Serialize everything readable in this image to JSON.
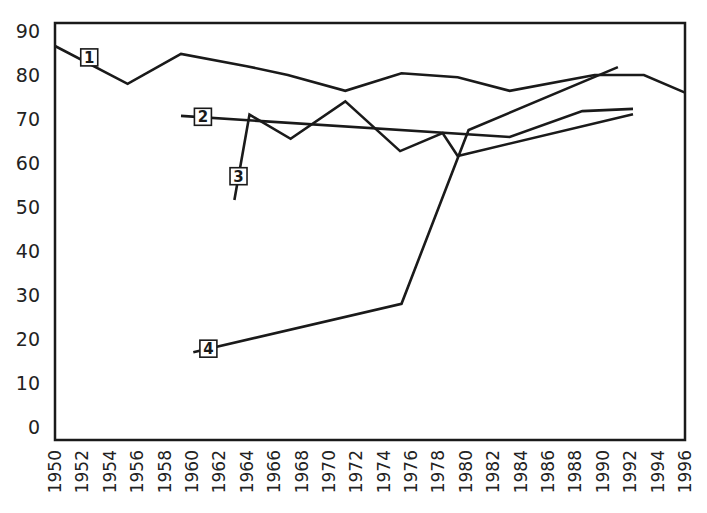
{
  "chart_data": {
    "type": "line",
    "title": "",
    "xlabel": "",
    "ylabel": "",
    "xlim": [
      1950,
      1996
    ],
    "ylim": [
      0,
      90
    ],
    "grid": false,
    "legend": "inline numbered boxes on each line",
    "y_ticks": [
      0,
      10,
      20,
      30,
      40,
      50,
      60,
      70,
      80,
      90
    ],
    "x_ticks": [
      1950,
      1952,
      1954,
      1956,
      1958,
      1960,
      1962,
      1964,
      1966,
      1968,
      1970,
      1972,
      1974,
      1976,
      1978,
      1980,
      1982,
      1984,
      1986,
      1988,
      1990,
      1992,
      1994,
      1996
    ],
    "series": [
      {
        "name": "1",
        "points": [
          [
            1950,
            86.6
          ],
          [
            1955.3,
            78
          ],
          [
            1959.2,
            84.8
          ],
          [
            1964,
            82
          ],
          [
            1967,
            80
          ],
          [
            1971.2,
            76.4
          ],
          [
            1975.3,
            80.4
          ],
          [
            1979.4,
            79.5
          ],
          [
            1983.2,
            76.4
          ],
          [
            1989.4,
            80
          ],
          [
            1993,
            80
          ],
          [
            1996,
            76
          ]
        ],
        "label_at": [
          1952.5,
          84
        ]
      },
      {
        "name": "2",
        "points": [
          [
            1959.2,
            70.7
          ],
          [
            1983.2,
            65.9
          ],
          [
            1988.5,
            71.8
          ],
          [
            1992.2,
            72.3
          ]
        ],
        "label_at": [
          1960.8,
          70.5
        ]
      },
      {
        "name": "3",
        "points": [
          [
            1963.1,
            51.6
          ],
          [
            1964.2,
            71
          ],
          [
            1967.2,
            65.5
          ],
          [
            1971.2,
            74
          ],
          [
            1975.2,
            62.7
          ],
          [
            1978.3,
            66.8
          ],
          [
            1979.4,
            61.6
          ],
          [
            1992.2,
            71.1
          ]
        ],
        "label_at": [
          1963.4,
          57
        ]
      },
      {
        "name": "4",
        "points": [
          [
            1960.1,
            17
          ],
          [
            1975.3,
            28
          ],
          [
            1980.2,
            67.5
          ],
          [
            1991.1,
            81.8
          ]
        ],
        "label_at": [
          1961.2,
          17.8
        ]
      }
    ]
  }
}
